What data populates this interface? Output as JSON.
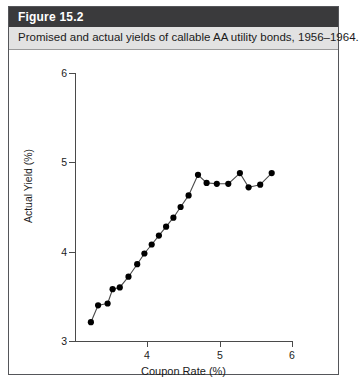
{
  "figure": {
    "number_label": "Figure 15.2",
    "caption": "Promised and actual yields of callable AA utility bonds, 1956–1964.",
    "header_bg": "#3a3a3c",
    "caption_bg": "#e2e2e2",
    "border_color": "#55565a"
  },
  "chart_data": {
    "type": "scatter",
    "title": "",
    "xlabel": "Coupon Rate (%)",
    "ylabel": "Actual Yield (%)",
    "xlim": [
      3.0,
      6.0
    ],
    "ylim": [
      3.0,
      6.0
    ],
    "xticks": [
      4,
      5,
      6
    ],
    "xtick_labels": [
      "4",
      "5",
      "6"
    ],
    "yticks": [
      3,
      4,
      5,
      6
    ],
    "ytick_labels": [
      "3",
      "4",
      "5",
      "6"
    ],
    "grid": false,
    "legend": null,
    "marker_color": "#000000",
    "line_color": "#4a4a4a",
    "connected": true,
    "series": [
      {
        "name": "Actual yield vs coupon rate",
        "x": [
          3.22,
          3.32,
          3.45,
          3.52,
          3.62,
          3.74,
          3.86,
          3.96,
          4.06,
          4.16,
          4.26,
          4.36,
          4.46,
          4.57,
          4.7,
          4.82,
          4.96,
          5.12,
          5.28,
          5.4,
          5.56,
          5.72
        ],
        "y": [
          3.21,
          3.4,
          3.42,
          3.58,
          3.6,
          3.72,
          3.86,
          3.98,
          4.08,
          4.18,
          4.28,
          4.38,
          4.5,
          4.63,
          4.86,
          4.77,
          4.76,
          4.76,
          4.88,
          4.72,
          4.75,
          4.88
        ]
      }
    ]
  }
}
